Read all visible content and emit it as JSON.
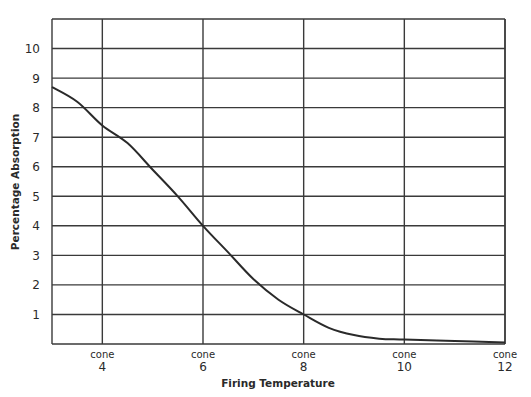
{
  "chart_data": {
    "type": "line",
    "title": "",
    "xlabel": "Firing Temperature",
    "ylabel": "Percentage Absorption",
    "x_tick_prefix": "cone",
    "x_ticks": [
      4,
      6,
      8,
      10,
      12
    ],
    "y_ticks": [
      1,
      2,
      3,
      4,
      5,
      6,
      7,
      8,
      9,
      10
    ],
    "xlim": [
      3,
      12
    ],
    "ylim": [
      0,
      11
    ],
    "grid": true,
    "legend": null,
    "series": [
      {
        "name": "Absorption",
        "x": [
          3,
          3.5,
          4,
          4.5,
          5,
          5.5,
          6,
          6.5,
          7,
          7.5,
          8,
          8.5,
          9,
          9.5,
          10,
          11,
          12
        ],
        "values": [
          8.7,
          8.2,
          7.4,
          6.8,
          5.9,
          5.0,
          4.0,
          3.1,
          2.2,
          1.5,
          1.0,
          0.55,
          0.3,
          0.18,
          0.15,
          0.1,
          0.05
        ]
      }
    ]
  }
}
